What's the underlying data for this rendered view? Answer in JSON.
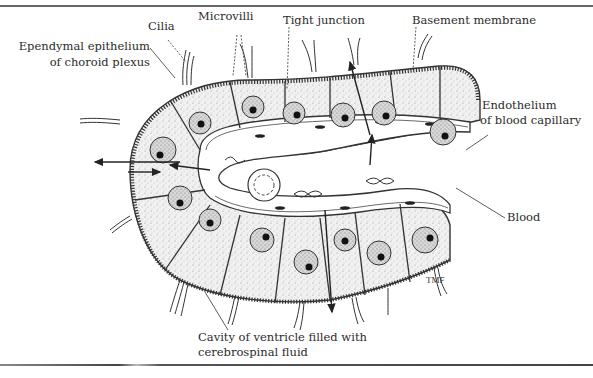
{
  "figure": {
    "labels": {
      "cilia": "Cilia",
      "microvilli": "Microvilli",
      "tight_junction": "Tight junction",
      "basement_membrane": "Basement membrane",
      "ependymal_line1": "Ependymal epithelium",
      "ependymal_line2": "of choroid  plexus",
      "endothelium_line1": "Endothelium",
      "endothelium_line2": "of blood capillary",
      "blood": "Blood",
      "cavity_line1": "Cavity of ventricle filled with",
      "cavity_line2": "cerebrospinal fluid"
    },
    "signature": "TMF",
    "colors": {
      "ink": "#2a2a2a",
      "cell_fill": "#e9e9e9",
      "lumen": "#ffffff",
      "rule": "#555555"
    }
  }
}
